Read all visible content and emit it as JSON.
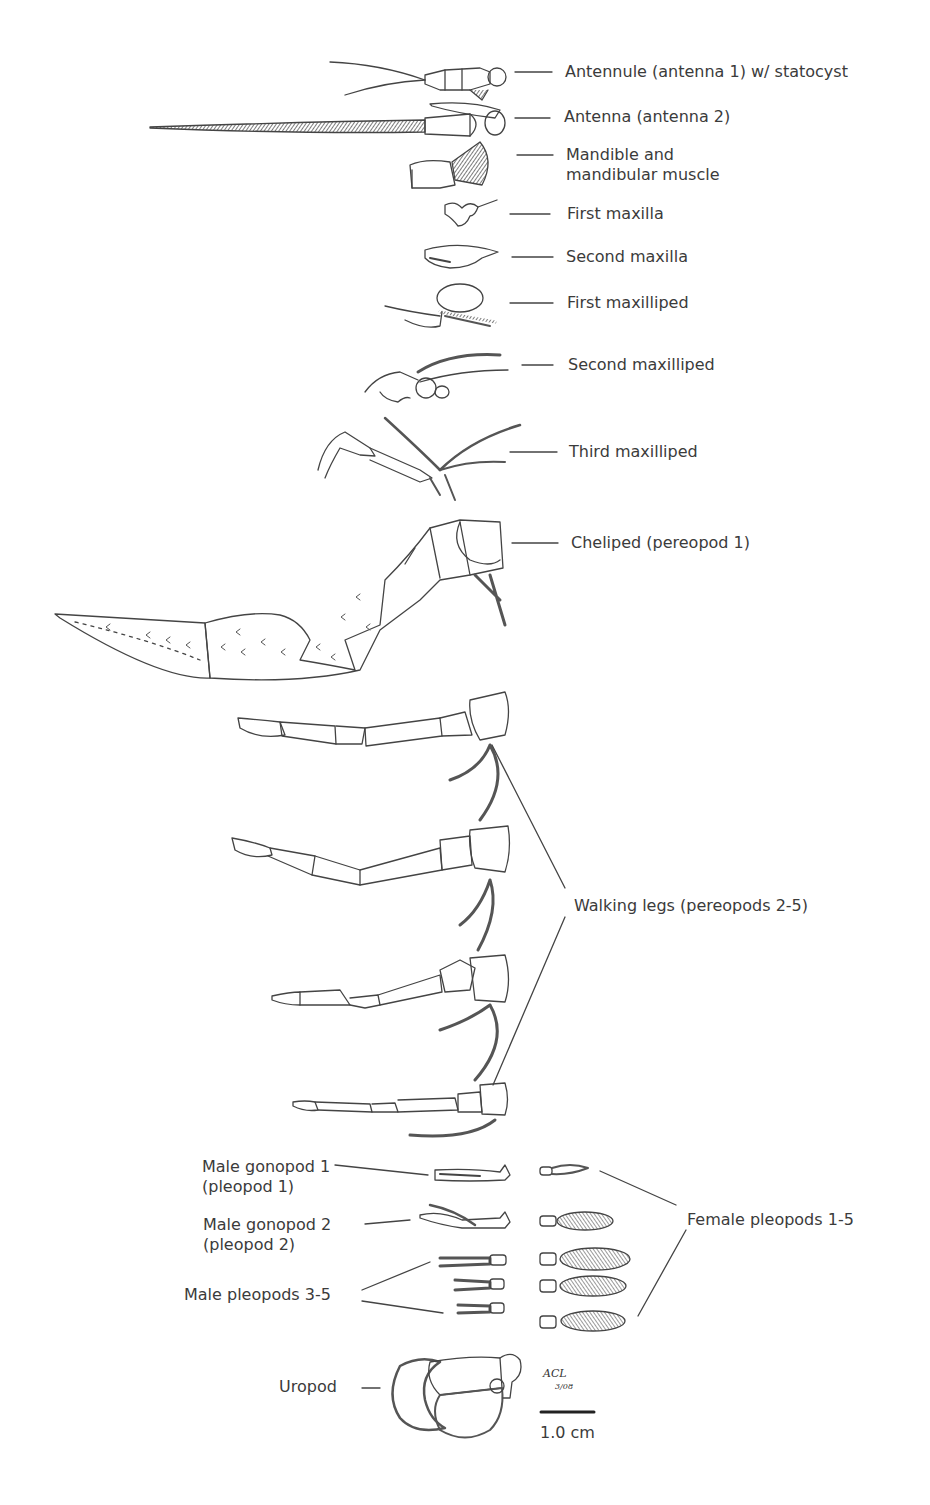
{
  "figure": {
    "labels": [
      {
        "id": "antennule",
        "text": "Antennule (antenna 1) w/ statocyst"
      },
      {
        "id": "antenna",
        "text": "Antenna (antenna 2)"
      },
      {
        "id": "mandible",
        "text": "Mandible and\nmandibular muscle"
      },
      {
        "id": "first-maxilla",
        "text": "First maxilla"
      },
      {
        "id": "second-maxilla",
        "text": "Second maxilla"
      },
      {
        "id": "first-maxilliped",
        "text": "First maxilliped"
      },
      {
        "id": "second-maxilliped",
        "text": "Second maxilliped"
      },
      {
        "id": "third-maxilliped",
        "text": "Third maxilliped"
      },
      {
        "id": "cheliped",
        "text": "Cheliped (pereopod 1)"
      },
      {
        "id": "walking-legs",
        "text": "Walking legs (pereopods 2-5)"
      },
      {
        "id": "male-gonopod-1",
        "text": "Male gonopod 1\n(pleopod 1)"
      },
      {
        "id": "male-gonopod-2",
        "text": "Male gonopod 2\n(pleopod 2)"
      },
      {
        "id": "male-pleopods",
        "text": "Male pleopods 3-5"
      },
      {
        "id": "female-pleopods",
        "text": "Female pleopods 1-5"
      },
      {
        "id": "uropod",
        "text": "Uropod"
      }
    ],
    "scale_bar": {
      "label": "1.0 cm"
    },
    "signature": {
      "initials": "ACL",
      "date": "3/08"
    }
  }
}
